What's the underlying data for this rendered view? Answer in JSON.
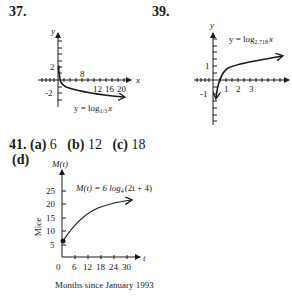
{
  "problems": [
    {
      "number": "37.",
      "graph": {
        "y_axis_label": "y",
        "x_axis_label": "x",
        "y_ticks": [
          "2",
          "-2"
        ],
        "x_ticks": [
          "8",
          "12",
          "16",
          "20"
        ],
        "equation_lhs": "y = log",
        "equation_base": "1/3",
        "equation_arg": "x"
      }
    },
    {
      "number": "39.",
      "graph": {
        "y_axis_label": "y",
        "x_axis_label": "x",
        "y_ticks": [
          "1",
          "-1"
        ],
        "x_ticks": [
          "1",
          "2",
          "3"
        ],
        "equation_lhs": "y = log",
        "equation_base": "2.718",
        "equation_arg": "x"
      }
    },
    {
      "number": "41.",
      "parts": [
        {
          "label": "(a)",
          "value": "6"
        },
        {
          "label": "(b)",
          "value": "12"
        },
        {
          "label": "(c)",
          "value": "18"
        },
        {
          "label": "(d)",
          "value": ""
        }
      ],
      "graph": {
        "y_axis_label": "M(t)",
        "x_axis_label": "t",
        "y_title": "Mice",
        "x_title": "Months since January 1993",
        "y_ticks": [
          "5",
          "10",
          "15",
          "20",
          "25"
        ],
        "x_ticks": [
          "0",
          "6",
          "12",
          "18",
          "24",
          "30"
        ],
        "equation_lhs": "M(t) = 6 log",
        "equation_base": "4",
        "equation_arg": "(2t + 4)"
      }
    }
  ]
}
